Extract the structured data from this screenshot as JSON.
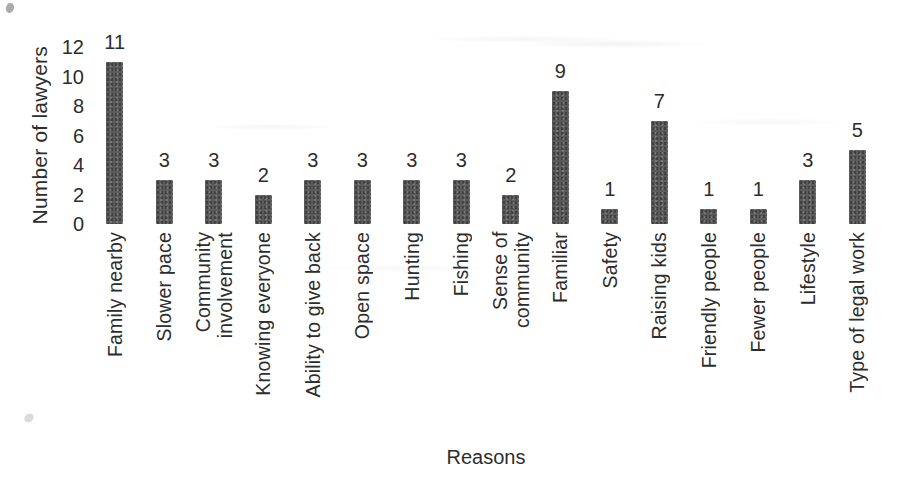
{
  "chart_data": {
    "type": "bar",
    "title": "",
    "xlabel": "Reasons",
    "ylabel": "Number of lawyers",
    "categories": [
      "Family nearby",
      "Slower pace",
      "Community\ninvolvement",
      "Knowing everyone",
      "Ability to give back",
      "Open space",
      "Hunting",
      "Fishing",
      "Sense of\ncommunity",
      "Familiar",
      "Safety",
      "Raising kids",
      "Friendly people",
      "Fewer people",
      "Lifestyle",
      "Type of legal work"
    ],
    "values": [
      11,
      3,
      3,
      2,
      3,
      3,
      3,
      3,
      2,
      9,
      1,
      7,
      1,
      1,
      3,
      5
    ],
    "value_labels": [
      "11",
      "3",
      "3",
      "2",
      "3",
      "3",
      "3",
      "3",
      "2",
      "9",
      "1",
      "7",
      "1",
      "1",
      "3",
      "5"
    ],
    "yticks": [
      12,
      10,
      8,
      6,
      4,
      2,
      0
    ],
    "ylim": [
      0,
      12
    ],
    "grid": false,
    "legend": null,
    "axis_spines": false,
    "bar_color": "#5b5b5b",
    "text_color": "#2d2d2d",
    "background_color": "#ffffff"
  }
}
